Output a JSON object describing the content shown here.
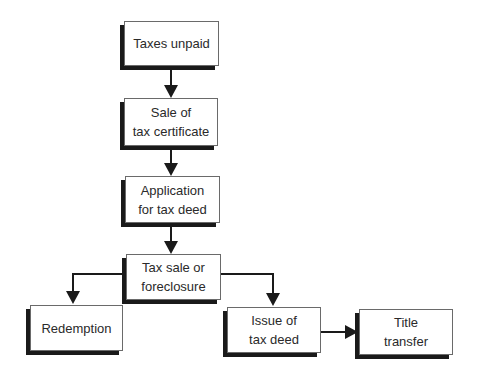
{
  "diagram": {
    "type": "flowchart",
    "nodes": [
      {
        "id": "taxes_unpaid",
        "label": "Taxes unpaid"
      },
      {
        "id": "sale_certificate",
        "label": "Sale of\ntax certificate"
      },
      {
        "id": "application",
        "label": "Application\nfor tax deed"
      },
      {
        "id": "tax_sale",
        "label": "Tax sale or\nforeclosure"
      },
      {
        "id": "redemption",
        "label": "Redemption"
      },
      {
        "id": "issue_deed",
        "label": "Issue of\ntax deed"
      },
      {
        "id": "title_transfer",
        "label": "Title\ntransfer"
      }
    ],
    "edges": [
      {
        "from": "taxes_unpaid",
        "to": "sale_certificate"
      },
      {
        "from": "sale_certificate",
        "to": "application"
      },
      {
        "from": "application",
        "to": "tax_sale"
      },
      {
        "from": "tax_sale",
        "to": "redemption"
      },
      {
        "from": "tax_sale",
        "to": "issue_deed"
      },
      {
        "from": "issue_deed",
        "to": "title_transfer"
      }
    ],
    "colors": {
      "line": "#1a1a1a",
      "box_border": "#6a6a6a",
      "shadow": "#1a1a1a",
      "text": "#2a2a2a"
    }
  }
}
